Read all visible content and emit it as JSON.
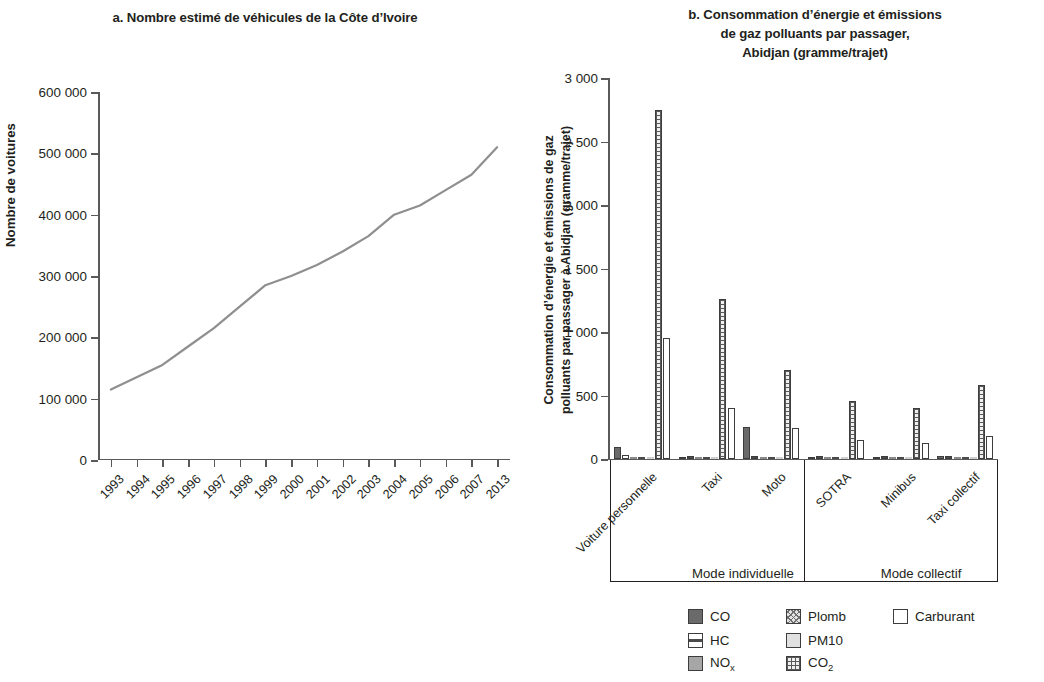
{
  "panel_a": {
    "title": "a. Nombre estimé de véhicules de la Côte d’Ivoire",
    "ylabel": "Nombre de voitures"
  },
  "panel_b": {
    "title_line1": "b. Consommation d’énergie et émissions",
    "title_line2": "de gaz polluants par passager,",
    "title_line3": "Abidjan (gramme/trajet)",
    "ylabel_line1": "Consommation d’énergie et émissions de gaz",
    "ylabel_line2": "polluants par passager à Abidjan (gramme/trajet)",
    "mode_individuelle": "Mode individuelle",
    "mode_collectif": "Mode collectif"
  },
  "legend": [
    {
      "key": "CO",
      "label": "CO",
      "pattern": "p-co"
    },
    {
      "key": "Plomb",
      "label": "Plomb",
      "pattern": "p-plomb"
    },
    {
      "key": "Carburant",
      "label": "Carburant",
      "pattern": "p-carb"
    },
    {
      "key": "HC",
      "label": "HC",
      "pattern": "p-hc"
    },
    {
      "key": "PM10",
      "label": "PM10",
      "pattern": "p-pm10"
    },
    {
      "key": "NOx",
      "label": "NOx",
      "pattern": "p-nox"
    },
    {
      "key": "CO2",
      "label": "CO2",
      "pattern": "p-co2"
    }
  ],
  "chart_data": [
    {
      "type": "line",
      "title": "a. Nombre estimé de véhicules de la Côte d’Ivoire",
      "xlabel": "",
      "ylabel": "Nombre de voitures",
      "ylim": [
        0,
        600000
      ],
      "yticks": [
        0,
        100000,
        200000,
        300000,
        400000,
        500000,
        600000
      ],
      "ytick_labels": [
        "0",
        "100 000",
        "200 000",
        "300 000",
        "400 000",
        "500 000",
        "600 000"
      ],
      "grid": false,
      "legend": "none",
      "categories": [
        "1993",
        "1994",
        "1995",
        "1996",
        "1997",
        "1998",
        "1999",
        "2000",
        "2001",
        "2002",
        "2003",
        "2004",
        "2005",
        "2006",
        "2007",
        "2013"
      ],
      "values": [
        115000,
        135000,
        155000,
        185000,
        215000,
        250000,
        285000,
        300000,
        318000,
        340000,
        365000,
        400000,
        415000,
        440000,
        465000,
        510000
      ],
      "series": [
        {
          "name": "Nombre de voitures",
          "values": [
            115000,
            135000,
            155000,
            185000,
            215000,
            250000,
            285000,
            300000,
            318000,
            340000,
            365000,
            400000,
            415000,
            440000,
            465000,
            510000
          ]
        }
      ]
    },
    {
      "type": "bar",
      "title": "b. Consommation d’énergie et émissions de gaz polluants par passager, Abidjan (gramme/trajet)",
      "xlabel": "",
      "ylabel": "Consommation d’énergie et émissions de gaz polluants par passager à Abidjan (gramme/trajet)",
      "ylim": [
        0,
        3000
      ],
      "yticks": [
        0,
        500,
        1000,
        1500,
        2000,
        2500,
        3000
      ],
      "ytick_labels": [
        "0",
        "500",
        "1 000",
        "1 500",
        "2 000",
        "2 500",
        "3 000"
      ],
      "grid": false,
      "legend": "bottom",
      "categories": [
        "Voiture personnelle",
        "Taxi",
        "Moto",
        "SOTRA",
        "Minibus",
        "Taxi collectif"
      ],
      "groups": [
        {
          "label": "Mode individuelle",
          "categories": [
            "Voiture personnelle",
            "Taxi",
            "Moto"
          ]
        },
        {
          "label": "Mode collectif",
          "categories": [
            "SOTRA",
            "Minibus",
            "Taxi collectif"
          ]
        }
      ],
      "series": [
        {
          "name": "CO",
          "pattern": "p-co",
          "values": [
            95,
            18,
            255,
            14,
            12,
            20
          ]
        },
        {
          "name": "HC",
          "pattern": "p-hc",
          "values": [
            28,
            26,
            22,
            20,
            24,
            22
          ]
        },
        {
          "name": "NOx",
          "pattern": "p-nox",
          "values": [
            14,
            10,
            12,
            8,
            18,
            12
          ]
        },
        {
          "name": "Plomb",
          "pattern": "p-plomb",
          "values": [
            6,
            5,
            5,
            4,
            5,
            5
          ]
        },
        {
          "name": "PM10",
          "pattern": "p-pm10",
          "values": [
            5,
            4,
            4,
            4,
            4,
            4
          ]
        },
        {
          "name": "CO2",
          "pattern": "p-co2",
          "values": [
            2750,
            1260,
            700,
            455,
            400,
            580
          ]
        },
        {
          "name": "Carburant",
          "pattern": "p-carb",
          "values": [
            950,
            400,
            245,
            150,
            125,
            185
          ]
        }
      ]
    }
  ]
}
